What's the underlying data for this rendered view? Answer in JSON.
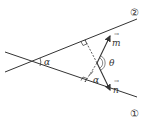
{
  "diagram": {
    "lines": [
      {
        "id": "line-1",
        "label": "①"
      },
      {
        "id": "line-2",
        "label": "②"
      }
    ],
    "angle_labels": {
      "alpha_intersection": "α",
      "alpha_inner": "α",
      "theta": "θ"
    },
    "vectors": {
      "m": {
        "label": "m",
        "arrow": "→"
      },
      "n": {
        "label": "n",
        "arrow": "→"
      }
    },
    "colors": {
      "stroke": "#333333",
      "background": "#ffffff"
    }
  }
}
